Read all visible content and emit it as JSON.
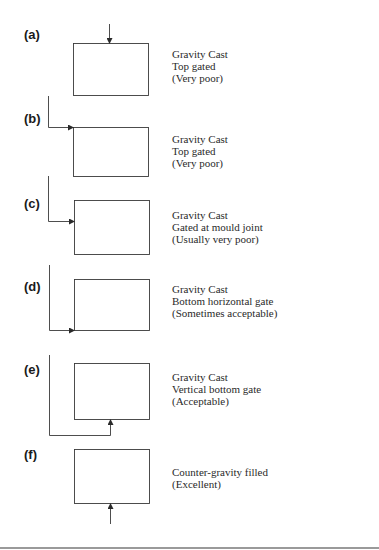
{
  "figure": {
    "panels": [
      {
        "id": "a",
        "label": "(a)",
        "lines": [
          "Gravity Cast",
          "Top gated",
          "(Very poor)"
        ]
      },
      {
        "id": "b",
        "label": "(b)",
        "lines": [
          "Gravity Cast",
          "Top gated",
          "(Very poor)"
        ]
      },
      {
        "id": "c",
        "label": "(c)",
        "lines": [
          "Gravity Cast",
          "Gated at mould joint",
          "(Usually very poor)"
        ]
      },
      {
        "id": "d",
        "label": "(d)",
        "lines": [
          "Gravity Cast",
          "Bottom horizontal gate",
          "(Sometimes acceptable)"
        ]
      },
      {
        "id": "e",
        "label": "(e)",
        "lines": [
          "Gravity Cast",
          "Vertical bottom gate",
          "(Acceptable)"
        ]
      },
      {
        "id": "f",
        "label": "(f)",
        "lines": [
          "Counter-gravity filled",
          "(Excellent)"
        ]
      }
    ],
    "colors": {
      "stroke": "#3a3a3a",
      "text": "#2a2a2a",
      "rule": "#9a9a9a"
    }
  }
}
